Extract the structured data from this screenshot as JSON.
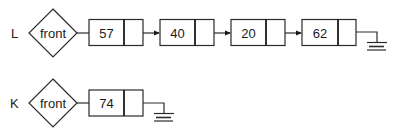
{
  "lists": [
    {
      "name": "L",
      "head_label": "front",
      "nodes": [
        {
          "value": "57"
        },
        {
          "value": "40"
        },
        {
          "value": "20"
        },
        {
          "value": "62"
        }
      ],
      "terminator": "ground-null"
    },
    {
      "name": "K",
      "head_label": "front",
      "nodes": [
        {
          "value": "74"
        }
      ],
      "terminator": "ground-null"
    }
  ],
  "colors": {
    "line": "#2a2a2a",
    "background": "#ffffff",
    "text": "#1a1a1a"
  }
}
